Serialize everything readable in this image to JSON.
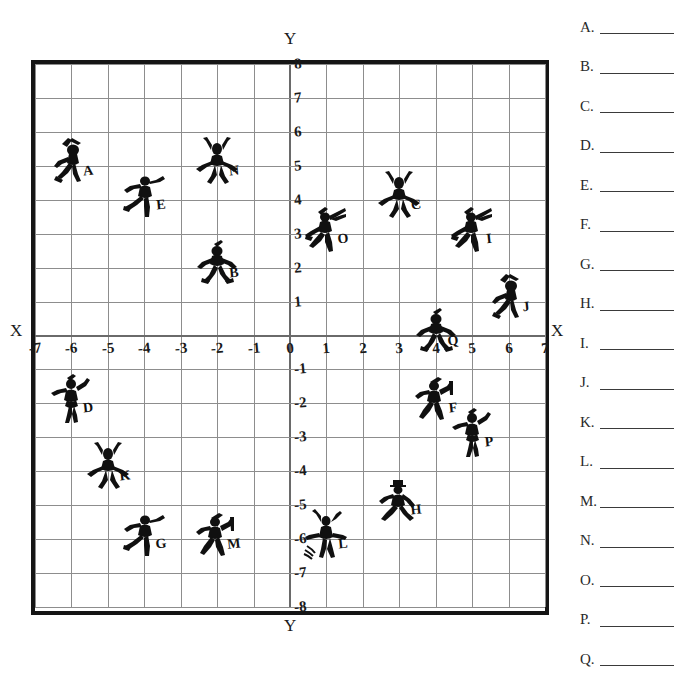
{
  "worksheet": {
    "axis_labels": {
      "x_left": "X",
      "x_right": "X",
      "y_top": "Y",
      "y_bottom": "Y"
    },
    "x_ticks": [
      "-7",
      "-6",
      "-5",
      "-4",
      "-3",
      "-2",
      "-1",
      "0",
      "1",
      "2",
      "3",
      "4",
      "5",
      "6",
      "7"
    ],
    "y_ticks": [
      "8",
      "7",
      "6",
      "5",
      "4",
      "3",
      "2",
      "1",
      "0",
      "-1",
      "-2",
      "-3",
      "-4",
      "-5",
      "-6",
      "-7",
      "-8"
    ],
    "grid": {
      "x_min": -7,
      "x_max": 7,
      "y_min": -8,
      "y_max": 8
    },
    "answers": [
      {
        "letter": "A."
      },
      {
        "letter": "B."
      },
      {
        "letter": "C."
      },
      {
        "letter": "D."
      },
      {
        "letter": "E."
      },
      {
        "letter": "F."
      },
      {
        "letter": "G."
      },
      {
        "letter": "H."
      },
      {
        "letter": "I."
      },
      {
        "letter": "J."
      },
      {
        "letter": "K."
      },
      {
        "letter": "L."
      },
      {
        "letter": "M."
      },
      {
        "letter": "N."
      },
      {
        "letter": "O."
      },
      {
        "letter": "P."
      },
      {
        "letter": "Q."
      }
    ]
  },
  "chart_data": {
    "type": "scatter",
    "title": "",
    "xlabel": "X",
    "ylabel": "Y",
    "xlim": [
      -7,
      7
    ],
    "ylim": [
      -8,
      8
    ],
    "grid": true,
    "legend": "none",
    "points": [
      {
        "label": "A",
        "x": -6,
        "y": 5,
        "pose": "running-sword"
      },
      {
        "label": "B",
        "x": -2,
        "y": 2,
        "pose": "standing-arms-out"
      },
      {
        "label": "C",
        "x": 3,
        "y": 4,
        "pose": "standing-arms-up"
      },
      {
        "label": "D",
        "x": -6,
        "y": -2,
        "pose": "dancing"
      },
      {
        "label": "E",
        "x": -4,
        "y": 4,
        "pose": "running-leaping"
      },
      {
        "label": "F",
        "x": 4,
        "y": -2,
        "pose": "running-flag"
      },
      {
        "label": "G",
        "x": -4,
        "y": -6,
        "pose": "running-leaping"
      },
      {
        "label": "H",
        "x": 3,
        "y": -5,
        "pose": "running-hat"
      },
      {
        "label": "I",
        "x": 5,
        "y": 3,
        "pose": "leaping-sword"
      },
      {
        "label": "J",
        "x": 6,
        "y": 1,
        "pose": "running-sword"
      },
      {
        "label": "K",
        "x": -5,
        "y": -4,
        "pose": "standing-arms-up"
      },
      {
        "label": "L",
        "x": 1,
        "y": -6,
        "pose": "jumping-arms-up"
      },
      {
        "label": "M",
        "x": -2,
        "y": -6,
        "pose": "running-flag"
      },
      {
        "label": "N",
        "x": -2,
        "y": 5,
        "pose": "standing-arms-up"
      },
      {
        "label": "O",
        "x": 1,
        "y": 3,
        "pose": "leaping-sword"
      },
      {
        "label": "P",
        "x": 5,
        "y": -3,
        "pose": "dancing"
      },
      {
        "label": "Q",
        "x": 4,
        "y": 0,
        "pose": "standing-arms-out"
      }
    ]
  }
}
